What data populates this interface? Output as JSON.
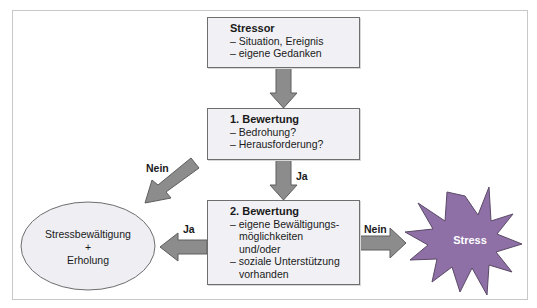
{
  "diagram": {
    "stressor_box": {
      "title": "Stressor",
      "lines": [
        "– Situation, Ereignis",
        "– eigene Gedanken"
      ]
    },
    "first_appraisal_box": {
      "title": "1. Bewertung",
      "lines": [
        "– Bedrohung?",
        "– Herausforderung?"
      ]
    },
    "second_appraisal_box": {
      "title": "2. Bewertung",
      "lines": [
        "– eigene Bewältigungs-",
        "möglichkeiten",
        "und/oder",
        "– soziale Unterstützung",
        "vorhanden"
      ]
    },
    "coping_ellipse": {
      "lines": [
        "Stressbewältigung",
        "+",
        "Erholung"
      ]
    },
    "stress_burst": {
      "label": "Stress"
    },
    "edge_labels": {
      "first_to_second": "Ja",
      "first_to_coping": "Nein",
      "second_to_coping": "Ja",
      "second_to_stress": "Nein"
    },
    "colors": {
      "box_fill": "#f1f1f5",
      "box_border": "#6e6e6e",
      "arrow_fill": "#8c8c8c",
      "arrow_border": "#5e5e5e",
      "ellipse_fill": "#eeeef3",
      "burst_fill": "#8e6fa6",
      "burst_text": "#ffffff"
    }
  }
}
